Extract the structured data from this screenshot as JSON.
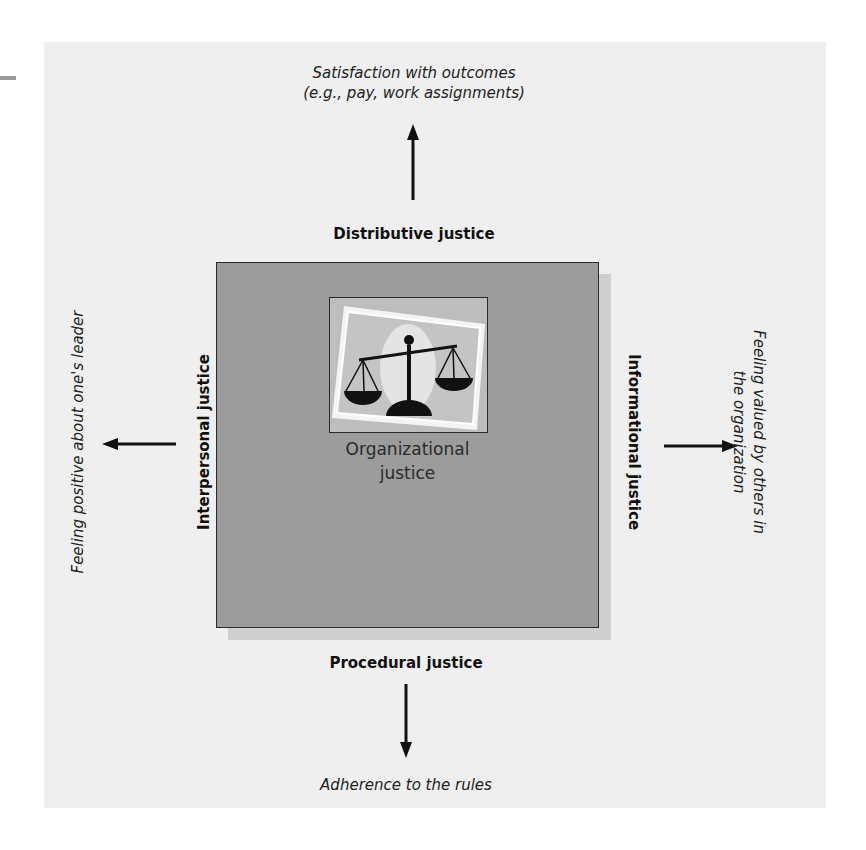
{
  "diagram": {
    "center": {
      "line1": "Organizational",
      "line2": "justice",
      "icon": "balance-scale-icon"
    },
    "top": {
      "label": "Distributive justice",
      "outcome_line1": "Satisfaction with outcomes",
      "outcome_line2": "(e.g., pay, work assignments)",
      "arrow_direction": "up"
    },
    "bottom": {
      "label": "Procedural justice",
      "outcome": "Adherence to the rules",
      "arrow_direction": "down"
    },
    "left": {
      "label": "Interpersonal justice",
      "outcome": "Feeling positive about one's leader",
      "arrow_direction": "left"
    },
    "right": {
      "label": "Informational justice",
      "outcome_line1": "Feeling valued by others in",
      "outcome_line2": "the organization",
      "arrow_direction": "right"
    },
    "colors": {
      "panel": "#efefef",
      "box": "#9c9c9c",
      "box_shadow": "#cfcfcf",
      "frame": "#bdbdbd",
      "ink": "#111111"
    }
  }
}
